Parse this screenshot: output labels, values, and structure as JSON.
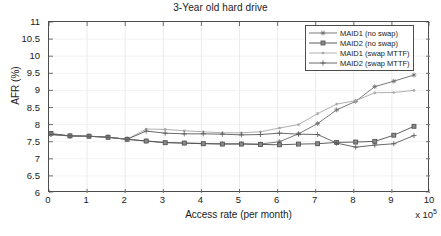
{
  "chart_data": {
    "type": "line",
    "title": "3-Year old hard drive",
    "xlabel": "Access rate (per month)",
    "ylabel": "AFR (%)",
    "x_multiplier": "x 10",
    "x_multiplier_exp": "5",
    "xlim": [
      0,
      10
    ],
    "ylim": [
      6,
      11
    ],
    "xticks": [
      0,
      1,
      2,
      3,
      4,
      5,
      6,
      7,
      8,
      9,
      10
    ],
    "xticklabels": [
      "0",
      "1",
      "2",
      "3",
      "4",
      "5",
      "6",
      "7",
      "8",
      "9",
      "10"
    ],
    "yticks": [
      6,
      6.5,
      7,
      7.5,
      8,
      8.5,
      9,
      9.5,
      10,
      10.5,
      11
    ],
    "yticklabels": [
      "6",
      "6.5",
      "7",
      "7.5",
      "8",
      "8.5",
      "9",
      "9.5",
      "10",
      "10.5",
      "11"
    ],
    "grid": true,
    "legend_position": "top-right",
    "x": [
      0.05,
      0.55,
      1.05,
      1.55,
      2.05,
      2.55,
      3.05,
      3.55,
      4.05,
      4.55,
      5.05,
      5.55,
      6.05,
      6.55,
      7.05,
      7.55,
      8.05,
      8.55,
      9.05,
      9.58
    ],
    "series": [
      {
        "name": "MAID1 (no swap)",
        "marker": "asterisk",
        "color": "#6b6b6b",
        "values": [
          7.72,
          7.67,
          7.66,
          7.63,
          7.57,
          7.52,
          7.48,
          7.46,
          7.45,
          7.44,
          7.44,
          7.43,
          7.5,
          7.73,
          8.03,
          8.43,
          8.68,
          9.11,
          9.27,
          9.45
        ]
      },
      {
        "name": "MAID2 (no swap)",
        "marker": "square",
        "color": "#4d4d4d",
        "values": [
          7.74,
          7.67,
          7.66,
          7.63,
          7.57,
          7.52,
          7.47,
          7.46,
          7.44,
          7.43,
          7.43,
          7.42,
          7.41,
          7.43,
          7.44,
          7.48,
          7.49,
          7.51,
          7.69,
          7.95
        ]
      },
      {
        "name": "MAID1 (swap MTTF)",
        "marker": "dot",
        "color": "#a6a6a6",
        "values": [
          7.7,
          7.67,
          7.66,
          7.63,
          7.57,
          7.87,
          7.86,
          7.82,
          7.79,
          7.76,
          7.76,
          7.79,
          7.9,
          8.0,
          8.32,
          8.6,
          8.7,
          8.93,
          8.94,
          9.0
        ]
      },
      {
        "name": "MAID2 (swap MTTF)",
        "marker": "plus",
        "color": "#595959",
        "values": [
          7.71,
          7.67,
          7.66,
          7.63,
          7.57,
          7.81,
          7.75,
          7.73,
          7.73,
          7.72,
          7.7,
          7.71,
          7.75,
          7.72,
          7.71,
          7.46,
          7.34,
          7.4,
          7.44,
          7.68
        ]
      }
    ]
  },
  "legend": {
    "items": [
      {
        "label": "MAID1 (no swap)"
      },
      {
        "label": "MAID2 (no swap)"
      },
      {
        "label": "MAID1 (swap MTTF)"
      },
      {
        "label": "MAID2 (swap MTTF)"
      }
    ]
  }
}
